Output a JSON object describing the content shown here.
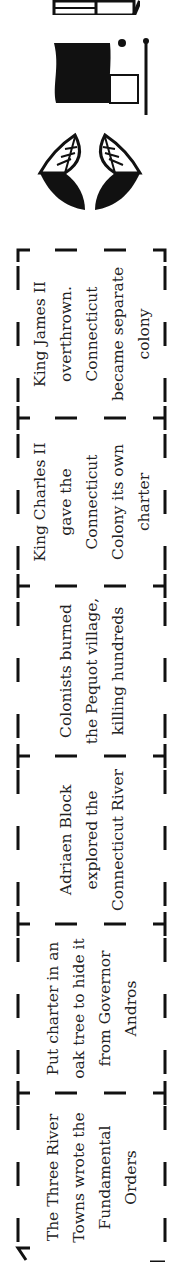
{
  "timeline": {
    "events": [
      {
        "id": 1,
        "text": "The Three River Towns wrote the Fundamental Orders"
      },
      {
        "id": 2,
        "text": "Put charter in an oak tree to hide it from Governor Andros"
      },
      {
        "id": 3,
        "text": "Adriaen Block explored the Connecticut River"
      },
      {
        "id": 4,
        "text": "Colonists burned the Pequot village, killing hundreds"
      },
      {
        "id": 5,
        "text": "King Charles II gave the Connecticut Colony its own charter"
      },
      {
        "id": 6,
        "text": "King James II overthrown. Connecticut became separate colony"
      }
    ],
    "icons": [
      {
        "name": "feathers-icon"
      },
      {
        "name": "flag-scroll-icon"
      },
      {
        "name": "house-icon"
      }
    ],
    "colors": {
      "ink": "#111111",
      "text": "#222222",
      "background": "#ffffff"
    }
  }
}
